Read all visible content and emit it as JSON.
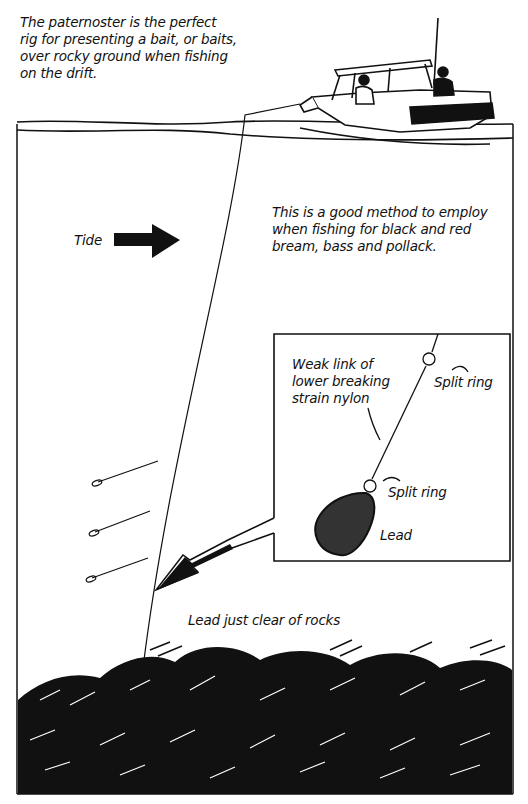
{
  "diagram": {
    "title_caption": [
      "The paternoster is the perfect",
      "rig for presenting a bait, or baits,",
      "over rocky ground when fishing",
      "on the drift."
    ],
    "method_caption": [
      "This is a good method to employ",
      "when fishing for black and red",
      "bream, bass and pollack."
    ],
    "tide_label": "Tide",
    "inset": {
      "weak_link_label": [
        "Weak link of",
        "lower breaking",
        "strain nylon"
      ],
      "split_ring_top_label": "Split ring",
      "split_ring_bottom_label": "Split ring",
      "lead_label": "Lead"
    },
    "lead_clear_label": "Lead just clear of rocks",
    "colors": {
      "ink": "#111111",
      "paper": "#ffffff"
    }
  }
}
